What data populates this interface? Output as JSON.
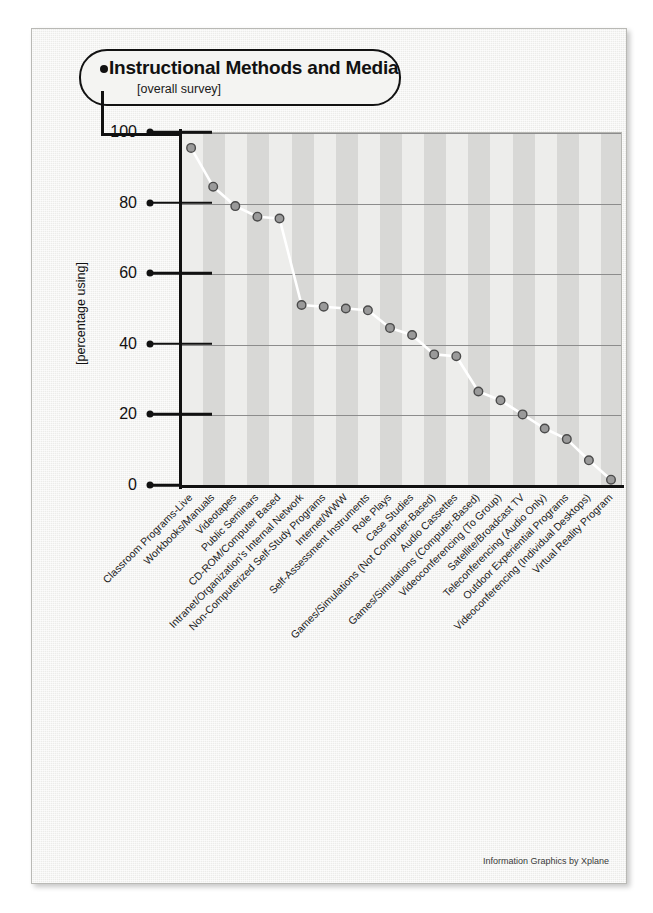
{
  "page": {
    "title": "Instructional Methods and Media",
    "subtitle": "[overall survey]",
    "footer_credit": "Information Graphics by Xplane",
    "colors": {
      "paper": "#f2f2f0",
      "plot_background": "#ededeb",
      "band": "#d8d8d6",
      "gridline": "#8c8c8c",
      "axis": "#111111",
      "marker_fill": "#9a9a9a",
      "marker_stroke": "#4a4a4a",
      "line": "#ffffff"
    }
  },
  "chart_data": {
    "type": "line",
    "title": "Instructional Methods and Media",
    "subtitle": "[overall survey]",
    "xlabel": "",
    "ylabel": "[percentage using]",
    "ylim": [
      0,
      100
    ],
    "yticks": [
      0,
      20,
      40,
      60,
      80,
      100
    ],
    "grid": "horizontal",
    "legend": "none",
    "categories": [
      "Classroom Programs-Live",
      "Workbooks/Manuals",
      "Videotapes",
      "Public Seminars",
      "CD-ROM/Computer Based",
      "Intranet/Organization's Internal Network",
      "Non-Computerized Self-Study Programs",
      "Internet/WWW",
      "Self-Assessment Instruments",
      "Role Plays",
      "Case Studies",
      "Games/Simulations (Not Computer-Based)",
      "Audio Cassettes",
      "Games/Simulations (Computer-Based)",
      "Videoconferencing (To Group)",
      "Satellite/Broadcast TV",
      "Teleconferencing (Audio Only)",
      "Outdoor Experiential Programs",
      "Videoconferencing (Individual Desktops)",
      "Virtual Reality Program"
    ],
    "values": [
      95.5,
      84.5,
      79,
      76,
      75.5,
      51,
      50.5,
      50,
      49.5,
      44.5,
      42.5,
      37,
      36.5,
      26.5,
      24,
      20,
      16,
      13,
      7,
      1.5
    ],
    "value_unit": "percent"
  },
  "axis": {
    "y_tick_labels": [
      "100",
      "80",
      "60",
      "40",
      "20",
      "0"
    ],
    "y_axis_title": "[percentage using]"
  }
}
